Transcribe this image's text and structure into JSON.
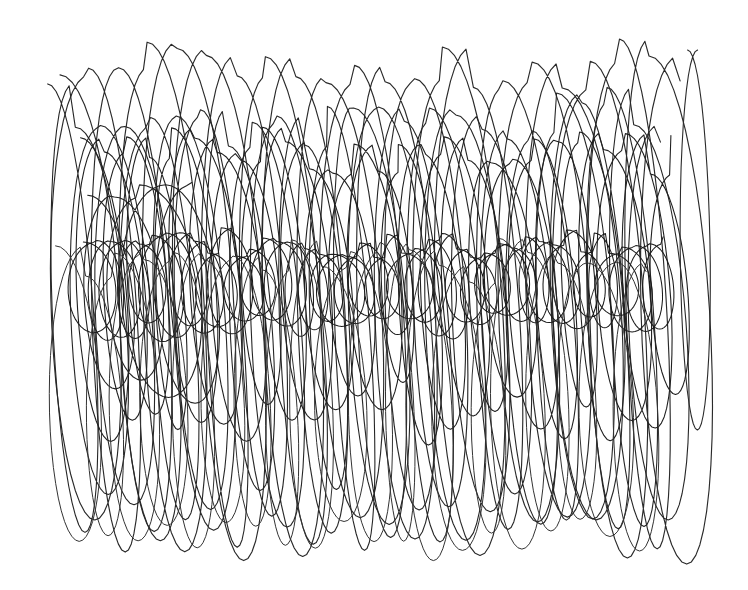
{
  "image": {
    "width": 748,
    "height": 590,
    "background": "#ffffff",
    "description": "Abstract continuous-line pen scribble of overlapping tall looping ellipses drifting left-to-right, with a denser band of small loops across the middle"
  },
  "strokes": [
    {
      "name": "outer-tall-loops",
      "color": "#2a2a2a",
      "width": 1.15,
      "x_start": 70,
      "x_end": 690,
      "cy": 300,
      "cy_drift": 0,
      "rx": 34,
      "ry": 235,
      "ry_jitter": 22,
      "loops": 21,
      "tilt": 0.18,
      "seed": 3
    },
    {
      "name": "mid-tall-loops",
      "color": "#262626",
      "width": 1.1,
      "x_start": 60,
      "x_end": 670,
      "cy": 320,
      "cy_drift": 0,
      "rx": 30,
      "ry": 200,
      "ry_jitter": 30,
      "loops": 24,
      "tilt": 0.22,
      "seed": 11
    },
    {
      "name": "inner-medium-loops",
      "color": "#202020",
      "width": 1.1,
      "x_start": 90,
      "x_end": 680,
      "cy": 285,
      "cy_drift": 0,
      "rx": 26,
      "ry": 130,
      "ry_jitter": 25,
      "loops": 26,
      "tilt": 0.25,
      "seed": 23
    },
    {
      "name": "central-dense-band",
      "color": "#1a1a1a",
      "width": 1.05,
      "x_start": 85,
      "x_end": 665,
      "cy": 285,
      "cy_drift": 0,
      "rx": 22,
      "ry": 42,
      "ry_jitter": 12,
      "loops": 42,
      "tilt": 0.15,
      "seed": 37
    },
    {
      "name": "left-large-ovals",
      "color": "#222222",
      "width": 1.1,
      "x_start": 95,
      "x_end": 200,
      "cy": 290,
      "cy_drift": 0,
      "rx": 38,
      "ry": 100,
      "ry_jitter": 10,
      "loops": 4,
      "tilt": 0.3,
      "seed": 51
    },
    {
      "name": "lower-loops",
      "color": "#333333",
      "width": 1.0,
      "x_start": 60,
      "x_end": 650,
      "cy": 400,
      "cy_drift": 0,
      "rx": 28,
      "ry": 140,
      "ry_jitter": 18,
      "loops": 20,
      "tilt": 0.12,
      "seed": 67
    },
    {
      "name": "right-tail",
      "color": "#2a2a2a",
      "width": 1.1,
      "x_start": 690,
      "x_end": 700,
      "cy": 240,
      "cy_drift": 0,
      "rx": 14,
      "ry": 190,
      "ry_jitter": 0,
      "loops": 1,
      "tilt": 0.05,
      "seed": 81
    }
  ]
}
